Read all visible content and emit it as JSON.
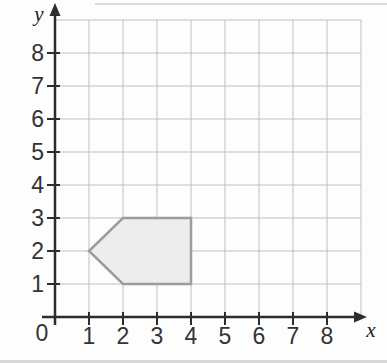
{
  "chart_data": {
    "type": "polygon",
    "xlabel": "x",
    "ylabel": "y",
    "origin_label": "0",
    "x_tick_labels": [
      "1",
      "2",
      "3",
      "4",
      "5",
      "6",
      "7",
      "8"
    ],
    "y_tick_labels": [
      "1",
      "2",
      "3",
      "4",
      "5",
      "6",
      "7",
      "8"
    ],
    "xlim": [
      0,
      9
    ],
    "ylim": [
      0,
      9
    ],
    "grid": "on",
    "shapes": [
      {
        "kind": "pentagon",
        "description": "left-pointing pentagon (arrow-like shape)",
        "vertices_xy": [
          [
            1,
            2
          ],
          [
            2,
            3
          ],
          [
            4,
            3
          ],
          [
            4,
            1
          ],
          [
            2,
            1
          ]
        ],
        "fill": "#ededed",
        "stroke": "#9c9c9c",
        "stroke_width": 2.5
      }
    ],
    "colors": {
      "grid_line": "#bfbfbf",
      "axis": "#2d2d2d",
      "tick_text": "#333333",
      "background": "#fdfdfd",
      "scan_artifact": "#d9d9d9"
    }
  }
}
